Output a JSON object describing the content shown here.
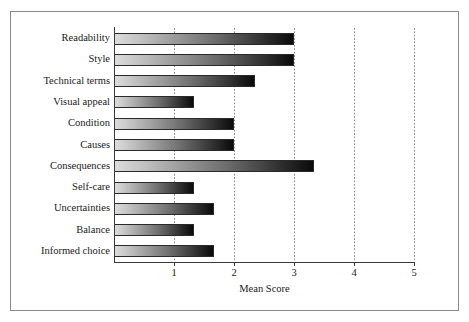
{
  "figure": {
    "background_color": "#ffffff",
    "frame_color": "#8b8b8b"
  },
  "chart_data": {
    "type": "bar",
    "orientation": "horizontal",
    "title": "",
    "xlabel": "Mean Score",
    "ylabel": "",
    "xlim": [
      0,
      5
    ],
    "xticks": [
      "1",
      "2",
      "3",
      "4",
      "5"
    ],
    "xtick_values": [
      1,
      2,
      3,
      4,
      5
    ],
    "grid": "vertical dotted gridlines at each x tick",
    "legend": "none",
    "bar_style": "horizontal gradient from light grey (#dcdcdc) at left to black (#0a0a0a) at right, thin dark outline",
    "categories": [
      "Readability",
      "Style",
      "Technical terms",
      "Visual appeal",
      "Condition",
      "Causes",
      "Consequences",
      "Self-care",
      "Uncertainties",
      "Balance",
      "Informed choice"
    ],
    "values": [
      3.0,
      3.0,
      2.35,
      1.33,
      2.0,
      2.0,
      3.33,
      1.33,
      1.67,
      1.33,
      1.67
    ]
  }
}
